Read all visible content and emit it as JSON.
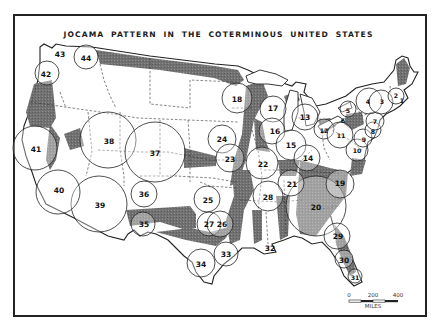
{
  "map": {
    "title": "JOCAMA PATTERN IN THE COTERMINOUS UNITED STATES",
    "colors": {
      "background": "#ffffff",
      "frame": "#222222",
      "shading": "#6e6e6e",
      "state_lines": "#444444",
      "circle_stroke": "#222222"
    },
    "regions": [
      {
        "id": 1,
        "label": "1",
        "x": 402,
        "y": 100,
        "r": 9
      },
      {
        "id": 2,
        "label": "2",
        "x": 396,
        "y": 95,
        "r": 9
      },
      {
        "id": 3,
        "label": "3",
        "x": 381,
        "y": 102,
        "r": 12
      },
      {
        "id": 4,
        "label": "4",
        "x": 369,
        "y": 101,
        "r": 13
      },
      {
        "id": 5,
        "label": "5",
        "x": 348,
        "y": 109,
        "r": 8
      },
      {
        "id": 6,
        "label": "6",
        "x": 343,
        "y": 119,
        "r": 7
      },
      {
        "id": 7,
        "label": "7",
        "x": 375,
        "y": 121,
        "r": 9
      },
      {
        "id": 8,
        "label": "8",
        "x": 373,
        "y": 130,
        "r": 8
      },
      {
        "id": 9,
        "label": "9",
        "x": 363,
        "y": 138,
        "r": 9
      },
      {
        "id": 10,
        "label": "10",
        "x": 357,
        "y": 150,
        "r": 11
      },
      {
        "id": 11,
        "label": "11",
        "x": 340,
        "y": 135,
        "r": 13
      },
      {
        "id": 12,
        "label": "12",
        "x": 324,
        "y": 129,
        "r": 10
      },
      {
        "id": 13,
        "label": "13",
        "x": 305,
        "y": 117,
        "r": 13
      },
      {
        "id": 14,
        "label": "14",
        "x": 307,
        "y": 158,
        "r": 13
      },
      {
        "id": 15,
        "label": "15",
        "x": 291,
        "y": 145,
        "r": 15
      },
      {
        "id": 16,
        "label": "16",
        "x": 272,
        "y": 131,
        "r": 13
      },
      {
        "id": 17,
        "label": "17",
        "x": 273,
        "y": 109,
        "r": 13
      },
      {
        "id": 18,
        "label": "18",
        "x": 237,
        "y": 98,
        "r": 15
      },
      {
        "id": 19,
        "label": "19",
        "x": 340,
        "y": 184,
        "r": 14
      },
      {
        "id": 20,
        "label": "20",
        "x": 316,
        "y": 206,
        "r": 30
      },
      {
        "id": 21,
        "label": "21",
        "x": 291,
        "y": 183,
        "r": 13
      },
      {
        "id": 22,
        "label": "22",
        "x": 262,
        "y": 163,
        "r": 16
      },
      {
        "id": 23,
        "label": "23",
        "x": 230,
        "y": 158,
        "r": 14
      },
      {
        "id": 24,
        "label": "24",
        "x": 222,
        "y": 139,
        "r": 14
      },
      {
        "id": 25,
        "label": "25",
        "x": 207,
        "y": 199,
        "r": 13
      },
      {
        "id": 26,
        "label": "26",
        "x": 220,
        "y": 224,
        "r": 13
      },
      {
        "id": 27,
        "label": "27",
        "x": 209,
        "y": 224,
        "r": 12
      },
      {
        "id": 28,
        "label": "28",
        "x": 268,
        "y": 196,
        "r": 15
      },
      {
        "id": 29,
        "label": "29",
        "x": 337,
        "y": 236,
        "r": 13
      },
      {
        "id": 30,
        "label": "30",
        "x": 344,
        "y": 259,
        "r": 9
      },
      {
        "id": 31,
        "label": "31",
        "x": 355,
        "y": 276,
        "r": 7
      },
      {
        "id": 32,
        "label": "32",
        "x": 270,
        "y": 247,
        "r": 0
      },
      {
        "id": 33,
        "label": "33",
        "x": 226,
        "y": 254,
        "r": 12
      },
      {
        "id": 34,
        "label": "34",
        "x": 201,
        "y": 263,
        "r": 14
      },
      {
        "id": 35,
        "label": "35",
        "x": 143,
        "y": 224,
        "r": 12
      },
      {
        "id": 36,
        "label": "36",
        "x": 144,
        "y": 194,
        "r": 13
      },
      {
        "id": 37,
        "label": "37",
        "x": 155,
        "y": 152,
        "r": 30
      },
      {
        "id": 38,
        "label": "38",
        "x": 108,
        "y": 140,
        "r": 28
      },
      {
        "id": 39,
        "label": "39",
        "x": 99,
        "y": 204,
        "r": 28
      },
      {
        "id": 40,
        "label": "40",
        "x": 58,
        "y": 190,
        "r": 25
      },
      {
        "id": 41,
        "label": "41",
        "x": 35,
        "y": 148,
        "r": 25
      },
      {
        "id": 42,
        "label": "42",
        "x": 47,
        "y": 73,
        "r": 12
      },
      {
        "id": 43,
        "label": "43",
        "x": 59,
        "y": 53,
        "r": 8
      },
      {
        "id": 44,
        "label": "44",
        "x": 86,
        "y": 57,
        "r": 12
      }
    ],
    "scale_bar": {
      "ticks": [
        "0",
        "200",
        "400"
      ],
      "unit": "MILES"
    }
  }
}
